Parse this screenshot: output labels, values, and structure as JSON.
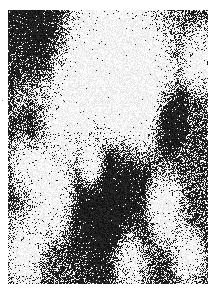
{
  "image": {
    "description": "Grayscale micrograph-like binary noise texture with large connected dark and light domains",
    "width": 200,
    "height": 274,
    "offset": {
      "x": 8,
      "y": 10
    },
    "colors": {
      "dark": "#1e1e1e",
      "light": "#f4f4f4",
      "background": "#ffffff"
    },
    "light_regions": [
      {
        "cx": 0.55,
        "cy": 0.12,
        "r": 0.35
      },
      {
        "cx": 0.3,
        "cy": 0.32,
        "r": 0.3
      },
      {
        "cx": 0.65,
        "cy": 0.3,
        "r": 0.22
      },
      {
        "cx": 0.95,
        "cy": 0.18,
        "r": 0.12
      },
      {
        "cx": 0.1,
        "cy": 0.55,
        "r": 0.12
      },
      {
        "cx": 0.22,
        "cy": 0.7,
        "r": 0.14
      },
      {
        "cx": 0.08,
        "cy": 0.88,
        "r": 0.14
      },
      {
        "cx": 0.78,
        "cy": 0.72,
        "r": 0.13
      },
      {
        "cx": 0.6,
        "cy": 0.9,
        "r": 0.12
      },
      {
        "cx": 0.9,
        "cy": 0.9,
        "r": 0.1
      },
      {
        "cx": 0.42,
        "cy": 0.58,
        "r": 0.08
      }
    ],
    "dark_regions": [
      {
        "cx": 0.18,
        "cy": 0.1,
        "r": 0.22
      },
      {
        "cx": 0.8,
        "cy": 0.4,
        "r": 0.12
      },
      {
        "cx": 0.12,
        "cy": 0.45,
        "r": 0.1
      },
      {
        "cx": 0.5,
        "cy": 0.72,
        "r": 0.25
      }
    ]
  }
}
